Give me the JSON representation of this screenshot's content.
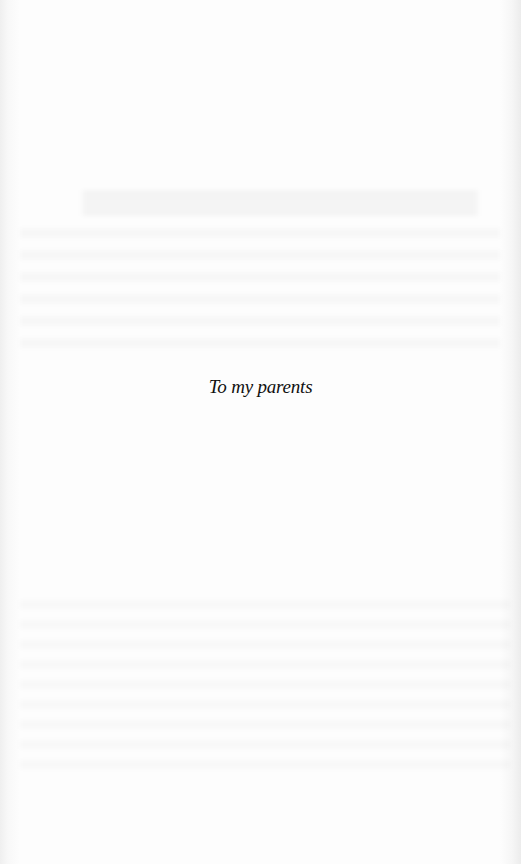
{
  "page": {
    "type": "dedication",
    "dedication_text": "To my parents"
  },
  "colors": {
    "background": "#fcfcfc",
    "text": "#111111"
  }
}
